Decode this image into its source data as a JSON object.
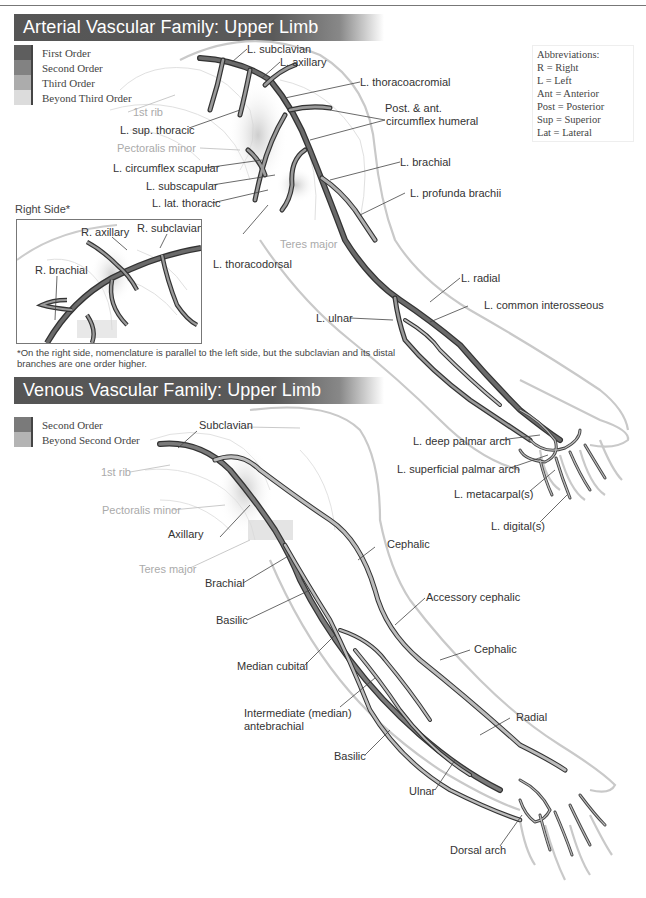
{
  "arterial": {
    "title": "Arterial Vascular Family: Upper Limb",
    "legend": [
      {
        "label": "First Order",
        "color": "#5e5e5e"
      },
      {
        "label": "Second Order",
        "color": "#828282"
      },
      {
        "label": "Third Order",
        "color": "#acacac"
      },
      {
        "label": "Beyond Third Order",
        "color": "#dcdcdc"
      }
    ],
    "abbreviations": {
      "title": "Abbreviations:",
      "items": [
        "R = Right",
        "L = Left",
        "Ant = Anterior",
        "Post = Posterior",
        "Sup = Superior",
        "Lat = Lateral"
      ]
    },
    "labels": {
      "subclavian": "L. subclavian",
      "axillary": "L. axillary",
      "thoracoacromial": "L. thoracoacromial",
      "circumflex_humeral_1": "Post. & ant.",
      "circumflex_humeral_2": "circumflex humeral",
      "first_rib": "1st rib",
      "sup_thoracic": "L. sup. thoracic",
      "pectoralis_minor": "Pectoralis minor",
      "circumflex_scapular": "L. circumflex scapular",
      "subscapular": "L. subscapular",
      "lat_thoracic": "L. lat. thoracic",
      "brachial": "L. brachial",
      "profunda_brachii": "L. profunda brachii",
      "teres_major": "Teres major",
      "thoracodorsal": "L. thoracodorsal",
      "radial": "L. radial",
      "common_interosseous": "L. common interosseous",
      "ulnar": "L. ulnar",
      "deep_palmar_arch": "L. deep palmar arch",
      "superficial_palmar_arch": "L. superficial palmar arch",
      "metacarpals": "L. metacarpal(s)",
      "digitals": "L. digital(s)"
    },
    "inset": {
      "title": "Right Side*",
      "axillary": "R. axillary",
      "subclavian": "R. subclavian",
      "brachial": "R. brachial"
    },
    "footnote": "*On the right side, nomenclature is parallel to the left side, but the subclavian and its distal branches are one order higher."
  },
  "venous": {
    "title": "Venous Vascular Family: Upper Limb",
    "legend": [
      {
        "label": "Second Order",
        "color": "#7a7a7a"
      },
      {
        "label": "Beyond Second Order",
        "color": "#b4b4b4"
      }
    ],
    "labels": {
      "subclavian": "Subclavian",
      "first_rib": "1st rib",
      "pectoralis_minor": "Pectoralis minor",
      "axillary": "Axillary",
      "teres_major": "Teres major",
      "brachial": "Brachial",
      "basilic_upper": "Basilic",
      "cephalic_upper": "Cephalic",
      "accessory_cephalic": "Accessory cephalic",
      "cephalic_lower": "Cephalic",
      "median_cubital": "Median cubital",
      "intermediate_1": "Intermediate (median)",
      "intermediate_2": "antebrachial",
      "radial": "Radial",
      "basilic_lower": "Basilic",
      "ulnar": "Ulnar",
      "dorsal_arch": "Dorsal arch"
    }
  }
}
